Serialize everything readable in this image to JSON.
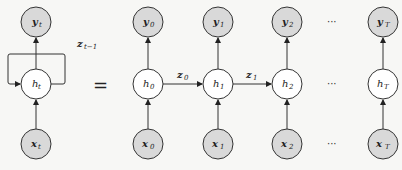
{
  "diagram": {
    "type": "rnn-unrolled",
    "colors": {
      "background": "#f7f7f5",
      "observed_node_fill": "#d9d9d9",
      "hidden_node_fill": "#ffffff",
      "stroke": "#333333"
    },
    "folded": {
      "output": {
        "base": "y",
        "sub": "t"
      },
      "hidden": {
        "base": "h",
        "sub": "t"
      },
      "input": {
        "base": "x",
        "sub": "t"
      },
      "recurrent_label": {
        "base": "z",
        "sub": "t−1"
      }
    },
    "equals": "=",
    "unrolled": {
      "steps": [
        {
          "output": {
            "base": "y",
            "sub": "0"
          },
          "hidden": {
            "base": "h",
            "sub": "0"
          },
          "input": {
            "base": "x",
            "sub": "0"
          },
          "edge": {
            "base": "z",
            "sub": "0"
          }
        },
        {
          "output": {
            "base": "y",
            "sub": "1"
          },
          "hidden": {
            "base": "h",
            "sub": "1"
          },
          "input": {
            "base": "x",
            "sub": "1"
          },
          "edge": {
            "base": "z",
            "sub": "1"
          }
        },
        {
          "output": {
            "base": "y",
            "sub": "2"
          },
          "hidden": {
            "base": "h",
            "sub": "2"
          },
          "input": {
            "base": "x",
            "sub": "2"
          }
        },
        {
          "output": {
            "base": "y",
            "sub": "T"
          },
          "hidden": {
            "base": "h",
            "sub": "T"
          },
          "input": {
            "base": "x",
            "sub": "T"
          }
        }
      ],
      "ellipsis": "···"
    }
  }
}
